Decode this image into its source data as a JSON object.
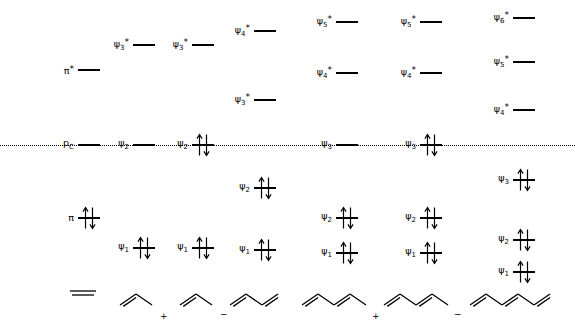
{
  "figure": {
    "type": "molecular-orbital-energy-level-diagram",
    "width": 575,
    "height": 330,
    "background": "#ffffff",
    "line_color": "#000000",
    "nonbonding_reference": {
      "label": "p",
      "label_subscript": "C",
      "label_full": "pC",
      "style": "dotted",
      "y": 145,
      "x_start": 0,
      "x_end": 575
    }
  },
  "columns": [
    {
      "id": "ethylene",
      "name": "ethylene",
      "x": 78,
      "structure": "ethene",
      "charge": "",
      "levels": [
        {
          "label": "π",
          "starred": true,
          "sub": "",
          "y": 70,
          "electrons": 0
        },
        {
          "label": "p",
          "starred": false,
          "sub": "C",
          "y": 145,
          "electrons": 0,
          "is_reference_anchor": true
        },
        {
          "label": "π",
          "starred": false,
          "sub": "",
          "y": 218,
          "electrons": 2
        }
      ]
    },
    {
      "id": "allyl-cation",
      "name": "allyl cation",
      "x": 133,
      "structure": "allyl",
      "charge": "+",
      "levels": [
        {
          "label": "ψ",
          "starred": true,
          "sub": "3",
          "y": 45,
          "electrons": 0
        },
        {
          "label": "ψ",
          "starred": false,
          "sub": "2",
          "y": 145,
          "electrons": 0
        },
        {
          "label": "ψ",
          "starred": false,
          "sub": "1",
          "y": 248,
          "electrons": 2
        }
      ]
    },
    {
      "id": "allyl-anion",
      "name": "allyl anion",
      "x": 192,
      "structure": "allyl",
      "charge": "−",
      "levels": [
        {
          "label": "ψ",
          "starred": true,
          "sub": "3",
          "y": 45,
          "electrons": 0
        },
        {
          "label": "ψ",
          "starred": false,
          "sub": "2",
          "y": 145,
          "electrons": 2
        },
        {
          "label": "ψ",
          "starred": false,
          "sub": "1",
          "y": 248,
          "electrons": 2
        }
      ]
    },
    {
      "id": "butadiene",
      "name": "butadiene",
      "x": 254,
      "structure": "butadiene",
      "charge": "",
      "levels": [
        {
          "label": "ψ",
          "starred": true,
          "sub": "4",
          "y": 31,
          "electrons": 0
        },
        {
          "label": "ψ",
          "starred": true,
          "sub": "3",
          "y": 100,
          "electrons": 0
        },
        {
          "label": "ψ",
          "starred": false,
          "sub": "2",
          "y": 188,
          "electrons": 2
        },
        {
          "label": "ψ",
          "starred": false,
          "sub": "1",
          "y": 250,
          "electrons": 2
        }
      ]
    },
    {
      "id": "pentadienyl-cation",
      "name": "pentadienyl cation",
      "x": 336,
      "structure": "pentadienyl",
      "charge": "+",
      "levels": [
        {
          "label": "ψ",
          "starred": true,
          "sub": "5",
          "y": 22,
          "electrons": 0
        },
        {
          "label": "ψ",
          "starred": true,
          "sub": "4",
          "y": 73,
          "electrons": 0
        },
        {
          "label": "ψ",
          "starred": false,
          "sub": "3",
          "y": 145,
          "electrons": 0
        },
        {
          "label": "ψ",
          "starred": false,
          "sub": "2",
          "y": 218,
          "electrons": 2
        },
        {
          "label": "ψ",
          "starred": false,
          "sub": "1",
          "y": 253,
          "electrons": 2
        }
      ]
    },
    {
      "id": "pentadienyl-anion",
      "name": "pentadienyl anion",
      "x": 420,
      "structure": "pentadienyl",
      "charge": "−",
      "levels": [
        {
          "label": "ψ",
          "starred": true,
          "sub": "5",
          "y": 22,
          "electrons": 0
        },
        {
          "label": "ψ",
          "starred": true,
          "sub": "4",
          "y": 73,
          "electrons": 0
        },
        {
          "label": "ψ",
          "starred": false,
          "sub": "3",
          "y": 145,
          "electrons": 2
        },
        {
          "label": "ψ",
          "starred": false,
          "sub": "2",
          "y": 218,
          "electrons": 2
        },
        {
          "label": "ψ",
          "starred": false,
          "sub": "1",
          "y": 253,
          "electrons": 2
        }
      ]
    },
    {
      "id": "hexatriene",
      "name": "hexatriene",
      "x": 513,
      "structure": "hexatriene",
      "charge": "",
      "levels": [
        {
          "label": "ψ",
          "starred": true,
          "sub": "6",
          "y": 18,
          "electrons": 0
        },
        {
          "label": "ψ",
          "starred": true,
          "sub": "5",
          "y": 62,
          "electrons": 0
        },
        {
          "label": "ψ",
          "starred": true,
          "sub": "4",
          "y": 110,
          "electrons": 0
        },
        {
          "label": "ψ",
          "starred": false,
          "sub": "3",
          "y": 180,
          "electrons": 2
        },
        {
          "label": "ψ",
          "starred": false,
          "sub": "2",
          "y": 240,
          "electrons": 2
        },
        {
          "label": "ψ",
          "starred": false,
          "sub": "1",
          "y": 272,
          "electrons": 2
        }
      ]
    }
  ],
  "structures": {
    "ethene": {
      "x": 68,
      "bottom": 28,
      "charge_dx": 0,
      "charge_dy": 0
    },
    "allyl_1": {
      "x": 118,
      "bottom": 20,
      "charge": "+",
      "charge_dx": 42,
      "charge_dy": 22
    },
    "allyl_2": {
      "x": 178,
      "bottom": 20,
      "charge": "−",
      "charge_dx": 42,
      "charge_dy": 20
    },
    "butadiene": {
      "x": 228,
      "bottom": 20,
      "charge": "",
      "charge_dx": 0,
      "charge_dy": 0
    },
    "pentadienyl_1": {
      "x": 300,
      "bottom": 20,
      "charge": "+",
      "charge_dx": 72,
      "charge_dy": 22
    },
    "pentadienyl_2": {
      "x": 382,
      "bottom": 20,
      "charge": "−",
      "charge_dx": 72,
      "charge_dy": 20
    },
    "hexatriene": {
      "x": 468,
      "bottom": 20,
      "charge": "",
      "charge_dx": 0,
      "charge_dy": 0
    }
  }
}
